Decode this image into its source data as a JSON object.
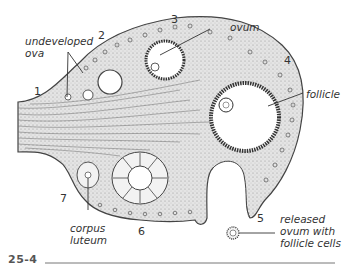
{
  "figure": {
    "number": "25-4",
    "stage_numbers": [
      "1",
      "2",
      "3",
      "4",
      "5",
      "6",
      "7"
    ]
  },
  "labels": {
    "undeveloped_ova_line1": "undeveloped",
    "undeveloped_ova_line2": "ova",
    "ovum": "ovum",
    "follicle": "follicle",
    "corpus_luteum_line1": "corpus",
    "corpus_luteum_line2": "luteum",
    "released_line1": "released",
    "released_line2": "ovum with",
    "released_line3": "follicle cells"
  },
  "colors": {
    "ink": "#333333",
    "tissue_fill": "#d9d9d9",
    "cavity_fill": "#ffffff",
    "background": "#ffffff"
  }
}
